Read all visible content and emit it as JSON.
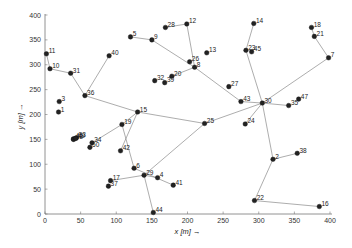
{
  "chart_data": {
    "type": "scatter",
    "title": "",
    "xlabel": "x [m] →",
    "ylabel": "y [m] →",
    "xlim": [
      0,
      400
    ],
    "ylim": [
      0,
      400
    ],
    "xticks": [
      0,
      50,
      100,
      150,
      200,
      250,
      300,
      350,
      400
    ],
    "yticks": [
      0,
      50,
      100,
      150,
      200,
      250,
      300,
      350,
      400
    ],
    "grid": false,
    "legend": "none",
    "nodes": [
      {
        "id": "1",
        "x": 19,
        "y": 205
      },
      {
        "id": "2",
        "x": 320,
        "y": 110
      },
      {
        "id": "3",
        "x": 20,
        "y": 226
      },
      {
        "id": "4",
        "x": 158,
        "y": 73
      },
      {
        "id": "5",
        "x": 120,
        "y": 356
      },
      {
        "id": "6",
        "x": 125,
        "y": 92
      },
      {
        "id": "7",
        "x": 398,
        "y": 314
      },
      {
        "id": "8",
        "x": 210,
        "y": 295
      },
      {
        "id": "9",
        "x": 150,
        "y": 350
      },
      {
        "id": "10",
        "x": 7,
        "y": 292
      },
      {
        "id": "11",
        "x": 2,
        "y": 322
      },
      {
        "id": "12",
        "x": 199,
        "y": 382
      },
      {
        "id": "13",
        "x": 227,
        "y": 324
      },
      {
        "id": "14",
        "x": 293,
        "y": 383
      },
      {
        "id": "15",
        "x": 130,
        "y": 205
      },
      {
        "id": "16",
        "x": 385,
        "y": 15
      },
      {
        "id": "17",
        "x": 92,
        "y": 67
      },
      {
        "id": "18",
        "x": 374,
        "y": 375
      },
      {
        "id": "19",
        "x": 108,
        "y": 180
      },
      {
        "id": "20",
        "x": 178,
        "y": 277
      },
      {
        "id": "21",
        "x": 378,
        "y": 357
      },
      {
        "id": "22",
        "x": 294,
        "y": 27
      },
      {
        "id": "23",
        "x": 282,
        "y": 329
      },
      {
        "id": "24",
        "x": 281,
        "y": 181
      },
      {
        "id": "25",
        "x": 224,
        "y": 182
      },
      {
        "id": "26",
        "x": 203,
        "y": 306
      },
      {
        "id": "27",
        "x": 258,
        "y": 256
      },
      {
        "id": "28",
        "x": 169,
        "y": 375
      },
      {
        "id": "29",
        "x": 139,
        "y": 78
      },
      {
        "id": "30",
        "x": 305,
        "y": 223
      },
      {
        "id": "31",
        "x": 36,
        "y": 283
      },
      {
        "id": "32",
        "x": 154,
        "y": 268
      },
      {
        "id": "33",
        "x": 44,
        "y": 153
      },
      {
        "id": "34",
        "x": 66,
        "y": 143
      },
      {
        "id": "35",
        "x": 342,
        "y": 218
      },
      {
        "id": "36",
        "x": 56,
        "y": 238
      },
      {
        "id": "37",
        "x": 89,
        "y": 56
      },
      {
        "id": "38",
        "x": 354,
        "y": 122
      },
      {
        "id": "39",
        "x": 168,
        "y": 264
      },
      {
        "id": "40",
        "x": 90,
        "y": 318
      },
      {
        "id": "41",
        "x": 180,
        "y": 58
      },
      {
        "id": "42",
        "x": 106,
        "y": 127
      },
      {
        "id": "43",
        "x": 275,
        "y": 226
      },
      {
        "id": "44",
        "x": 152,
        "y": 3
      },
      {
        "id": "45",
        "x": 290,
        "y": 326
      },
      {
        "id": "46",
        "x": 40,
        "y": 151
      },
      {
        "id": "47",
        "x": 356,
        "y": 231
      },
      {
        "id": "48",
        "x": 40,
        "y": 150
      },
      {
        "id": "49",
        "x": 43,
        "y": 152
      },
      {
        "id": "50",
        "x": 63,
        "y": 134
      }
    ],
    "edges": [
      [
        "11",
        "10"
      ],
      [
        "10",
        "31"
      ],
      [
        "31",
        "36"
      ],
      [
        "36",
        "40"
      ],
      [
        "36",
        "15"
      ],
      [
        "15",
        "19"
      ],
      [
        "19",
        "34"
      ],
      [
        "15",
        "42"
      ],
      [
        "15",
        "25"
      ],
      [
        "25",
        "30"
      ],
      [
        "25",
        "29"
      ],
      [
        "29",
        "17"
      ],
      [
        "29",
        "4"
      ],
      [
        "29",
        "44"
      ],
      [
        "6",
        "19"
      ],
      [
        "5",
        "9"
      ],
      [
        "9",
        "8"
      ],
      [
        "28",
        "12"
      ],
      [
        "12",
        "8"
      ],
      [
        "8",
        "20"
      ],
      [
        "8",
        "43"
      ],
      [
        "43",
        "30"
      ],
      [
        "30",
        "23"
      ],
      [
        "23",
        "14"
      ],
      [
        "30",
        "7"
      ],
      [
        "7",
        "21"
      ],
      [
        "21",
        "18"
      ],
      [
        "30",
        "35"
      ],
      [
        "30",
        "2"
      ],
      [
        "2",
        "38"
      ],
      [
        "2",
        "22"
      ],
      [
        "22",
        "16"
      ],
      [
        "30",
        "24"
      ],
      [
        "6",
        "41"
      ],
      [
        "41",
        "19b"
      ]
    ]
  }
}
